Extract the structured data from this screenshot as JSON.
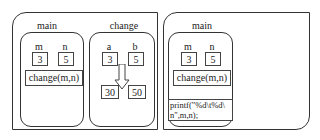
{
  "left_panel": {
    "main_frame": {
      "title": "main",
      "variables": [
        {
          "name": "m",
          "value": "3"
        },
        {
          "name": "n",
          "value": "5"
        }
      ],
      "call": "change(m,n)"
    },
    "change_frame": {
      "title": "change",
      "variables": [
        {
          "name": "a",
          "value": "3"
        },
        {
          "name": "b",
          "value": "5"
        }
      ],
      "arrow": "down-arrow",
      "new_values": [
        "30",
        "50"
      ]
    }
  },
  "right_panel": {
    "main_frame": {
      "title": "main",
      "variables": [
        {
          "name": "m",
          "value": "3"
        },
        {
          "name": "n",
          "value": "5"
        }
      ],
      "call": "change(m,n)",
      "printf_line1": "printf(\"%d\\t%d\\",
      "printf_line2": "n\",m,n);"
    }
  }
}
